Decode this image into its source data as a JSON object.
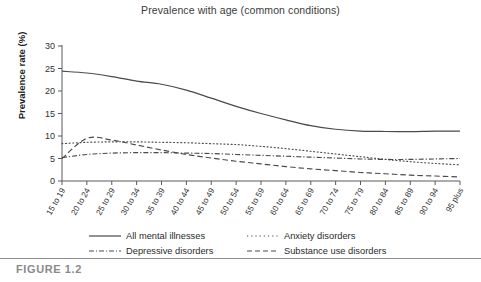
{
  "figure": {
    "caption": "FIGURE 1.2",
    "title": "Prevalence with age (common conditions)"
  },
  "axes": {
    "ylabel": "Prevalence rate (%)",
    "xlabel": "",
    "ytick_labels": [
      "0",
      "5",
      "10",
      "15",
      "20",
      "25",
      "30"
    ]
  },
  "legend": {
    "items": [
      {
        "label": "All mental illnesses",
        "style": "solid",
        "color": "#4a4a4a"
      },
      {
        "label": "Anxiety disorders",
        "style": "dotted",
        "color": "#4a4a4a"
      },
      {
        "label": "Depressive disorders",
        "style": "dashdot",
        "color": "#4a4a4a"
      },
      {
        "label": "Substance use disorders",
        "style": "dashed",
        "color": "#4a4a4a"
      }
    ]
  },
  "colors": {
    "line": "#4a4a4a",
    "axis": "#5a5a5a",
    "text": "#2b2b2b",
    "caption": "#8a8a8a",
    "background": "#ffffff"
  },
  "chart_data": {
    "type": "line",
    "title": "Prevalence with age (common conditions)",
    "xlabel": "",
    "ylabel": "Prevalence rate (%)",
    "ylim": [
      0,
      30
    ],
    "ytick_step": 5,
    "grid": false,
    "legend_position": "below",
    "categories": [
      "15 to 19",
      "20 to 24",
      "25 to 29",
      "30 to 34",
      "35 to 39",
      "40 to 44",
      "45 to 49",
      "50 to 54",
      "55 to 59",
      "60 to 64",
      "65 to 69",
      "70 to 74",
      "75 to 79",
      "80 to 84",
      "85 to 89",
      "90 to 94",
      "95 plus"
    ],
    "series": [
      {
        "name": "All mental illnesses",
        "style": "solid",
        "values": [
          24.4,
          24.0,
          23.2,
          22.2,
          21.5,
          20.2,
          18.4,
          16.6,
          15.0,
          13.6,
          12.3,
          11.5,
          11.1,
          11.0,
          11.0,
          11.1,
          11.1
        ]
      },
      {
        "name": "Anxiety disorders",
        "style": "dotted",
        "values": [
          8.3,
          8.6,
          8.7,
          8.7,
          8.6,
          8.5,
          8.3,
          8.1,
          7.7,
          7.2,
          6.6,
          6.0,
          5.4,
          4.8,
          4.3,
          3.9,
          3.6
        ]
      },
      {
        "name": "Depressive disorders",
        "style": "dashdot",
        "values": [
          5.2,
          5.9,
          6.2,
          6.3,
          6.3,
          6.2,
          6.1,
          5.9,
          5.7,
          5.5,
          5.3,
          5.1,
          4.9,
          4.8,
          4.8,
          4.9,
          5.0
        ]
      },
      {
        "name": "Substance use disorders",
        "style": "dashed",
        "values": [
          5.0,
          9.5,
          9.1,
          8.0,
          6.9,
          5.9,
          5.1,
          4.4,
          3.8,
          3.2,
          2.7,
          2.3,
          1.9,
          1.6,
          1.3,
          1.1,
          0.9
        ]
      }
    ]
  }
}
